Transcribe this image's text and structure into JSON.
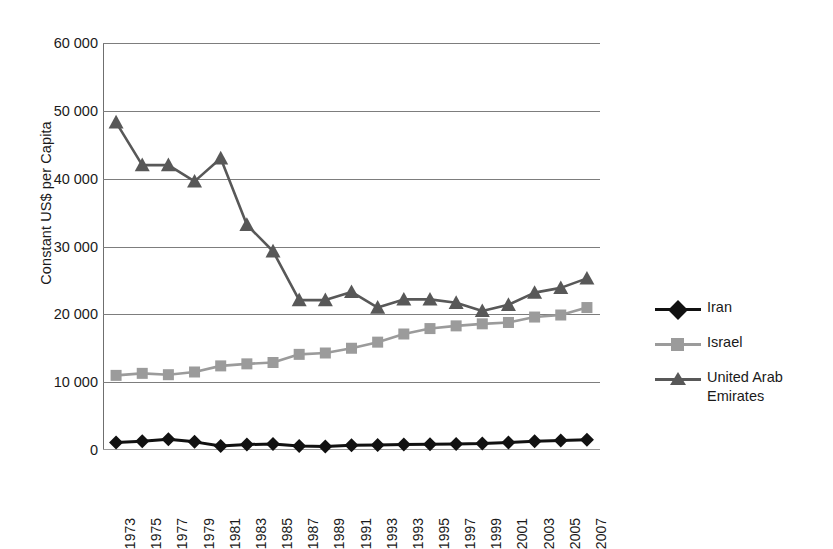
{
  "chart_data": {
    "type": "line",
    "title": "",
    "xlabel": "",
    "ylabel": "Constant US$ per Capita",
    "ylim": [
      0,
      60000
    ],
    "yticks": [
      0,
      10000,
      20000,
      30000,
      40000,
      50000,
      60000
    ],
    "ytick_labels": [
      "0",
      "10 000",
      "20 000",
      "30 000",
      "40 000",
      "50 000",
      "60 000"
    ],
    "grid": true,
    "legend_position": "right",
    "categories": [
      "1973",
      "1975",
      "1977",
      "1979",
      "1981",
      "1983",
      "1985",
      "1987",
      "1989",
      "1991",
      "1993",
      "1993",
      "1995",
      "1997",
      "1999",
      "2001",
      "2003",
      "2005",
      "2007"
    ],
    "series": [
      {
        "name": "Iran",
        "color": "#111111",
        "marker": "diamond",
        "values": [
          1100,
          1300,
          1600,
          1200,
          600,
          800,
          900,
          600,
          500,
          700,
          750,
          800,
          850,
          900,
          950,
          1100,
          1300,
          1400,
          1500
        ]
      },
      {
        "name": "Israel",
        "color": "#9b9b9b",
        "marker": "square",
        "values": [
          11000,
          11300,
          11100,
          11500,
          12400,
          12700,
          12900,
          14100,
          14300,
          15000,
          15900,
          17100,
          17900,
          18300,
          18600,
          18800,
          19600,
          19900,
          21000
        ]
      },
      {
        "name": "United Arab Emirates",
        "color": "#585858",
        "marker": "triangle",
        "values": [
          48300,
          42000,
          42000,
          39600,
          43000,
          33200,
          29300,
          22100,
          22100,
          23300,
          21000,
          22200,
          22200,
          21700,
          20500,
          21400,
          23200,
          23900,
          25300
        ]
      }
    ]
  },
  "legend": {
    "items": [
      {
        "label": "Iran"
      },
      {
        "label": "Israel"
      },
      {
        "label": "United Arab Emirates"
      }
    ]
  }
}
